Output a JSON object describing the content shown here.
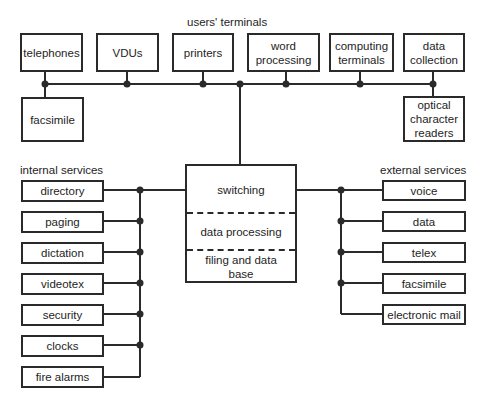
{
  "title": "users' terminals",
  "users_terminals": {
    "label": "users' terminals",
    "top_row": [
      "telephones",
      "VDUs",
      "printers",
      "word processing",
      "computing terminals",
      "data collection"
    ],
    "secondary": {
      "left": "facsimile",
      "right": "optical character readers"
    }
  },
  "central_system": {
    "sections": [
      "switching",
      "data processing",
      "filing and data base"
    ]
  },
  "internal_services": {
    "label": "internal services",
    "items": [
      "directory",
      "paging",
      "dictation",
      "videotex",
      "security",
      "clocks",
      "fire alarms"
    ]
  },
  "external_services": {
    "label": "external services",
    "items": [
      "voice",
      "data",
      "telex",
      "facsimile",
      "electronic mail"
    ]
  },
  "colors": {
    "line": "#2a2a2a",
    "background": "#ffffff"
  }
}
